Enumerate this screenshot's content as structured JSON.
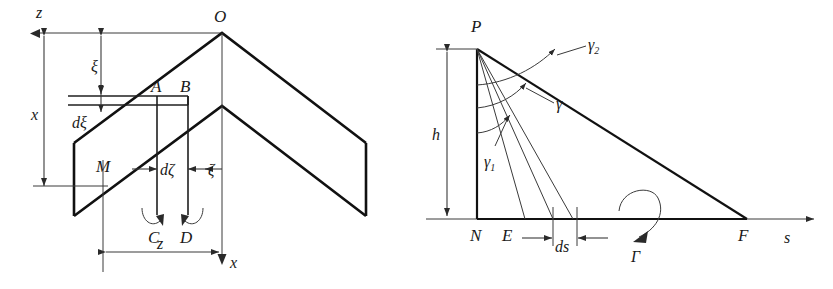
{
  "figure": {
    "kind": "two-panel-technical-line-diagram",
    "background": "#ffffff",
    "ink": "#111111"
  },
  "left_panel": {
    "name": "swept-wing-planform-vortex-diagram",
    "labels": {
      "axis_z_top": "z",
      "axis_x_bottom": "x",
      "apex": "O",
      "point_A": "A",
      "point_B": "B",
      "point_M": "M",
      "point_C": "C",
      "point_D": "D",
      "dim_x": "x",
      "dim_xi": "ξ",
      "dim_dxi": "dξ",
      "dim_zeta": "ζ",
      "dim_dzeta": "dζ",
      "dim_z": "z"
    }
  },
  "right_panel": {
    "name": "downwash-angle-triangle-diagram",
    "labels": {
      "apex_P": "P",
      "point_N": "N",
      "point_E": "E",
      "point_F": "F",
      "axis_s": "s",
      "dim_h": "h",
      "dim_ds": "ds",
      "angle_gamma": "γ",
      "angle_gamma1": "γ",
      "angle_gamma1_sub": "1",
      "angle_gamma2": "γ",
      "angle_gamma2_sub": "2",
      "circulation": "Γ"
    }
  }
}
